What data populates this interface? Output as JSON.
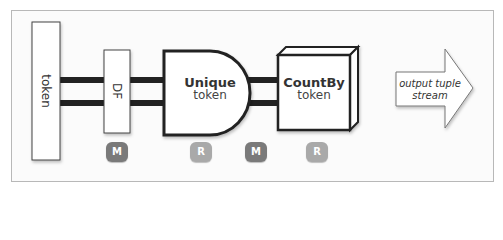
{
  "diagram": {
    "nodes": {
      "token_source": {
        "label": "token"
      },
      "df": {
        "label": "DF"
      },
      "unique": {
        "title": "Unique",
        "subtitle": "token"
      },
      "countby": {
        "title": "CountBy",
        "subtitle": "token"
      },
      "output": {
        "line1": "output tuple",
        "line2": "stream"
      }
    },
    "badges": [
      {
        "label": "M",
        "color": "#7a7a7a"
      },
      {
        "label": "R",
        "color": "#a9a9a9"
      },
      {
        "label": "M",
        "color": "#7a7a7a"
      },
      {
        "label": "R",
        "color": "#a9a9a9"
      }
    ],
    "colors": {
      "stroke": "#222222",
      "box_fill": "#ffffff",
      "frame_border": "#b8b8b8",
      "text": "#333333"
    }
  }
}
